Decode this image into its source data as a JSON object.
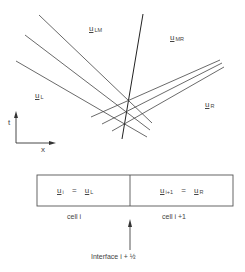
{
  "regions": {
    "left": {
      "symbol": "u",
      "subscript": "L"
    },
    "left_middle": {
      "symbol": "u",
      "subscript": "LM"
    },
    "middle_right": {
      "symbol": "u",
      "subscript": "MR"
    },
    "right": {
      "symbol": "u",
      "subscript": "R"
    }
  },
  "axes": {
    "t_label": "t",
    "x_label": "x"
  },
  "cells": {
    "left": {
      "lhs_symbol": "u",
      "lhs_subscript": "i",
      "equals": "=",
      "rhs_symbol": "u",
      "rhs_subscript": "L",
      "caption": "cell i"
    },
    "right": {
      "lhs_symbol": "u",
      "lhs_subscript": "i+1",
      "equals": "=",
      "rhs_symbol": "u",
      "rhs_subscript": "R",
      "caption": "cell i +1"
    }
  },
  "interface_label": "Interface  i + ½",
  "colors": {
    "line": "#333333",
    "box": "#555555"
  }
}
